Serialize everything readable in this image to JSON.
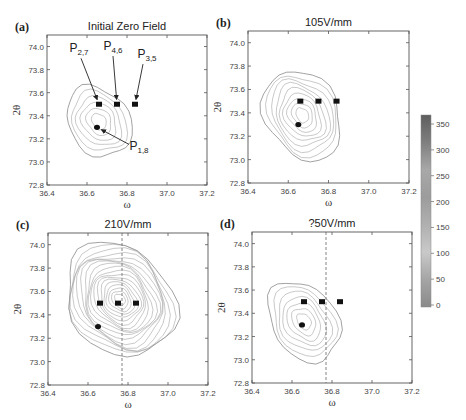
{
  "chart_data": [
    {
      "id": "a",
      "panel_label": "(a)",
      "type": "contour",
      "title": "Initial Zero Field",
      "xlabel": "ω",
      "ylabel": "2θ",
      "xlim": [
        36.4,
        37.2
      ],
      "ylim": [
        72.8,
        74.1
      ],
      "xticks": [
        "36.4",
        "36.6",
        "36.8",
        "37.0",
        "37.2"
      ],
      "yticks": [
        "72.8",
        "73.0",
        "73.2",
        "73.4",
        "73.6",
        "73.8",
        "74.0"
      ],
      "frame": {
        "x": 47,
        "y": 35,
        "w": 160,
        "h": 150
      },
      "peak": {
        "w": 36.66,
        "t": 73.35
      },
      "contours": 6,
      "spread": {
        "rw": 0.14,
        "rt": 0.3,
        "rot": -35
      },
      "dashed_line_omega": null,
      "markers": {
        "squares": [
          {
            "w": 36.66,
            "t": 73.5
          },
          {
            "w": 36.75,
            "t": 73.5
          },
          {
            "w": 36.84,
            "t": 73.5
          }
        ],
        "circles": [
          {
            "w": 36.65,
            "t": 73.3
          }
        ]
      },
      "annotations": [
        {
          "label": "P",
          "sub": "2,7",
          "tx": 36.56,
          "ty": 73.95,
          "target": {
            "w": 36.66,
            "t": 73.5
          }
        },
        {
          "label": "P",
          "sub": "4,6",
          "tx": 36.73,
          "ty": 73.97,
          "target": {
            "w": 36.75,
            "t": 73.5
          }
        },
        {
          "label": "P",
          "sub": "3,5",
          "tx": 36.9,
          "ty": 73.9,
          "target": {
            "w": 36.84,
            "t": 73.5
          }
        },
        {
          "label": "P",
          "sub": "1,8",
          "tx": 36.86,
          "ty": 73.1,
          "target": {
            "w": 36.65,
            "t": 73.3
          }
        }
      ]
    },
    {
      "id": "b",
      "panel_label": "(b)",
      "type": "contour",
      "title": "105V/mm",
      "xlabel": "ω",
      "ylabel": "2θ",
      "xlim": [
        36.4,
        37.2
      ],
      "ylim": [
        72.8,
        74.1
      ],
      "xticks": [
        "36.4",
        "36.6",
        "36.8",
        "37.0",
        "37.2"
      ],
      "yticks": [
        "72.8",
        "73.0",
        "73.2",
        "73.4",
        "73.6",
        "73.8",
        "74.0"
      ],
      "frame": {
        "x": 248,
        "y": 31,
        "w": 161,
        "h": 152
      },
      "peak": {
        "w": 36.67,
        "t": 73.38
      },
      "contours": 9,
      "spread": {
        "rw": 0.17,
        "rt": 0.38,
        "rot": -30
      },
      "dashed_line_omega": null,
      "markers": {
        "squares": [
          {
            "w": 36.66,
            "t": 73.5
          },
          {
            "w": 36.75,
            "t": 73.5
          },
          {
            "w": 36.84,
            "t": 73.5
          }
        ],
        "circles": [
          {
            "w": 36.65,
            "t": 73.3
          }
        ]
      },
      "annotations": []
    },
    {
      "id": "c",
      "panel_label": "(c)",
      "type": "contour",
      "title": "210V/mm",
      "xlabel": "ω",
      "ylabel": "2θ",
      "xlim": [
        36.4,
        37.2
      ],
      "ylim": [
        72.8,
        74.1
      ],
      "xticks": [
        "36.4",
        "36.6",
        "36.8",
        "37.0",
        "37.2"
      ],
      "yticks": [
        "72.8",
        "73.0",
        "73.2",
        "73.4",
        "73.6",
        "73.8",
        "74.0"
      ],
      "frame": {
        "x": 48,
        "y": 233,
        "w": 160,
        "h": 152
      },
      "peak": {
        "w": 36.76,
        "t": 73.53
      },
      "contours": 18,
      "spread": {
        "rw": 0.24,
        "rt": 0.5,
        "rot": -40
      },
      "dashed_line_omega": 36.77,
      "markers": {
        "squares": [
          {
            "w": 36.66,
            "t": 73.5
          },
          {
            "w": 36.75,
            "t": 73.5
          },
          {
            "w": 36.84,
            "t": 73.5
          }
        ],
        "circles": [
          {
            "w": 36.65,
            "t": 73.3
          }
        ]
      },
      "annotations": []
    },
    {
      "id": "d",
      "panel_label": "(d)",
      "type": "contour",
      "title": "?50V/mm",
      "xlabel": "ω",
      "ylabel": "2θ",
      "xlim": [
        36.4,
        37.2
      ],
      "ylim": [
        72.8,
        74.1
      ],
      "xticks": [
        "36.4",
        "36.6",
        "36.8",
        "37.0",
        "37.2"
      ],
      "yticks": [
        "72.8",
        "73.0",
        "73.2",
        "73.4",
        "73.6",
        "73.8",
        "74.0"
      ],
      "frame": {
        "x": 252,
        "y": 232,
        "w": 160,
        "h": 151
      },
      "peak": {
        "w": 36.66,
        "t": 73.33
      },
      "contours": 7,
      "spread": {
        "rw": 0.15,
        "rt": 0.35,
        "rot": -35
      },
      "dashed_line_omega": 36.77,
      "markers": {
        "squares": [
          {
            "w": 36.66,
            "t": 73.5
          },
          {
            "w": 36.75,
            "t": 73.5
          },
          {
            "w": 36.84,
            "t": 73.5
          }
        ],
        "circles": [
          {
            "w": 36.65,
            "t": 73.3
          }
        ]
      },
      "annotations": []
    }
  ],
  "colorbar": {
    "frame": {
      "x": 421,
      "y": 115,
      "w": 10,
      "h": 192
    },
    "range": [
      0,
      350
    ],
    "ticks": [
      "0",
      "50",
      "100",
      "150",
      "200",
      "250",
      "300",
      "350"
    ],
    "gradient": [
      "#8a8a8a",
      "#a5a5a5",
      "#c9c9c9",
      "#b0b0b0",
      "#9c9c9c",
      "#a8a8a8",
      "#7f7f7f",
      "#5e5e5e"
    ]
  },
  "colors": {
    "axis": "#555555",
    "contour": "#9a9a9a",
    "marker": "#111111",
    "dashed": "#777777"
  }
}
